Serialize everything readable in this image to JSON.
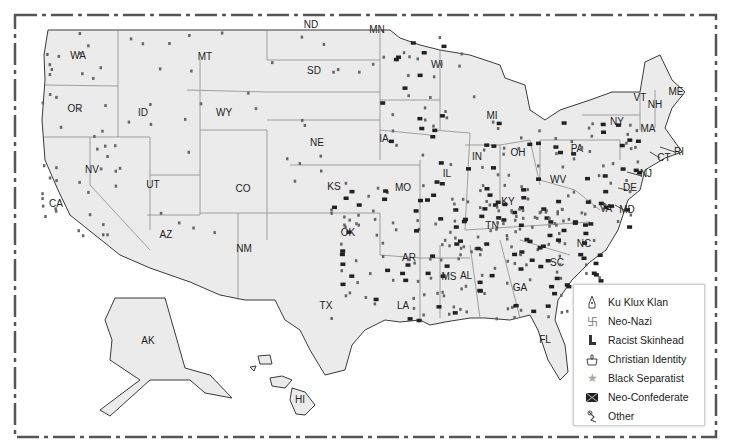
{
  "map": {
    "type": "hate group locations map",
    "states": [
      {
        "abbr": "WA",
        "x": 78,
        "y": 59
      },
      {
        "abbr": "OR",
        "x": 75,
        "y": 112
      },
      {
        "abbr": "CA",
        "x": 56,
        "y": 207
      },
      {
        "abbr": "NV",
        "x": 92,
        "y": 173
      },
      {
        "abbr": "ID",
        "x": 143,
        "y": 116
      },
      {
        "abbr": "MT",
        "x": 205,
        "y": 60
      },
      {
        "abbr": "WY",
        "x": 224,
        "y": 116
      },
      {
        "abbr": "UT",
        "x": 153,
        "y": 188
      },
      {
        "abbr": "CO",
        "x": 243,
        "y": 192
      },
      {
        "abbr": "AZ",
        "x": 166,
        "y": 238
      },
      {
        "abbr": "NM",
        "x": 244,
        "y": 252
      },
      {
        "abbr": "ND",
        "x": 311,
        "y": 28
      },
      {
        "abbr": "SD",
        "x": 314,
        "y": 74
      },
      {
        "abbr": "NE",
        "x": 317,
        "y": 146
      },
      {
        "abbr": "KS",
        "x": 334,
        "y": 190
      },
      {
        "abbr": "OK",
        "x": 348,
        "y": 236
      },
      {
        "abbr": "TX",
        "x": 326,
        "y": 309
      },
      {
        "abbr": "MN",
        "x": 377,
        "y": 33
      },
      {
        "abbr": "IA",
        "x": 384,
        "y": 142
      },
      {
        "abbr": "MO",
        "x": 403,
        "y": 191
      },
      {
        "abbr": "AR",
        "x": 409,
        "y": 261
      },
      {
        "abbr": "LA",
        "x": 403,
        "y": 309
      },
      {
        "abbr": "WI",
        "x": 437,
        "y": 68
      },
      {
        "abbr": "IL",
        "x": 447,
        "y": 177
      },
      {
        "abbr": "MI",
        "x": 492,
        "y": 119
      },
      {
        "abbr": "IN",
        "x": 477,
        "y": 160
      },
      {
        "abbr": "OH",
        "x": 518,
        "y": 156
      },
      {
        "abbr": "KY",
        "x": 508,
        "y": 205
      },
      {
        "abbr": "TN",
        "x": 492,
        "y": 229
      },
      {
        "abbr": "MS",
        "x": 449,
        "y": 280
      },
      {
        "abbr": "AL",
        "x": 466,
        "y": 279
      },
      {
        "abbr": "GA",
        "x": 520,
        "y": 291
      },
      {
        "abbr": "FL",
        "x": 545,
        "y": 343
      },
      {
        "abbr": "SC",
        "x": 557,
        "y": 266
      },
      {
        "abbr": "NC",
        "x": 584,
        "y": 247
      },
      {
        "abbr": "VA",
        "x": 606,
        "y": 212
      },
      {
        "abbr": "WV",
        "x": 558,
        "y": 183
      },
      {
        "abbr": "PA",
        "x": 577,
        "y": 152
      },
      {
        "abbr": "NY",
        "x": 617,
        "y": 125
      },
      {
        "abbr": "VT",
        "x": 640,
        "y": 101
      },
      {
        "abbr": "NH",
        "x": 655,
        "y": 108
      },
      {
        "abbr": "ME",
        "x": 676,
        "y": 95
      },
      {
        "abbr": "MA",
        "x": 648,
        "y": 132
      },
      {
        "abbr": "CT",
        "x": 664,
        "y": 161
      },
      {
        "abbr": "RI",
        "x": 679,
        "y": 155
      },
      {
        "abbr": "NJ",
        "x": 646,
        "y": 177
      },
      {
        "abbr": "DE",
        "x": 630,
        "y": 191
      },
      {
        "abbr": "MD",
        "x": 627,
        "y": 213
      },
      {
        "abbr": "AK",
        "x": 148,
        "y": 344
      },
      {
        "abbr": "HI",
        "x": 300,
        "y": 403
      }
    ]
  },
  "legend": {
    "items": [
      {
        "label": "Ku Klux Klan",
        "icon": "hood-icon",
        "color": "#555555"
      },
      {
        "label": "Neo-Nazi",
        "icon": "swastika-icon",
        "color": "#777777"
      },
      {
        "label": "Racist Skinhead",
        "icon": "boot-icon",
        "color": "#333333"
      },
      {
        "label": "Christian Identity",
        "icon": "cross-fire-icon",
        "color": "#444444"
      },
      {
        "label": "Black Separatist",
        "icon": "star-icon",
        "color": "#999999"
      },
      {
        "label": "Neo-Confederate",
        "icon": "confederate-flag-icon",
        "color": "#222222"
      },
      {
        "label": "Other",
        "icon": "other-icon",
        "color": "#555555"
      }
    ]
  },
  "colors": {
    "land": "#ebebeb",
    "border": "#8a8a8a",
    "coast": "#3a3a3a",
    "frame": "#555555",
    "background": "#ffffff"
  }
}
